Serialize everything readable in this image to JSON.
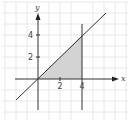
{
  "diagram": {
    "title": "",
    "x_axis_label": "x",
    "y_axis_label": "y",
    "x_ticks": [
      {
        "value": 2,
        "label": "2"
      },
      {
        "value": 4,
        "label": "4"
      }
    ],
    "y_ticks": [
      {
        "value": 2,
        "label": "2"
      },
      {
        "value": 4,
        "label": "4"
      }
    ],
    "line": {
      "equation": "y = x"
    },
    "vertical_line": {
      "equation": "x = 4"
    },
    "shaded_region": {
      "description": "triangle bounded by y = x, x = 4, and the x-axis",
      "vertices": [
        [
          0,
          0
        ],
        [
          4,
          0
        ],
        [
          4,
          4
        ]
      ]
    },
    "colors": {
      "grid": "#e6e6e6",
      "axis": "#333333",
      "line": "#333333",
      "shade": "#d3d3d3"
    }
  }
}
